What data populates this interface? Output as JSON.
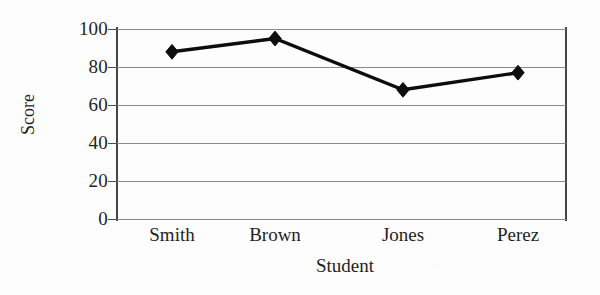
{
  "chart_data": {
    "type": "line",
    "title": "",
    "subtitle": "",
    "xlabel": "Student",
    "ylabel": "Score",
    "categories": [
      "Smith",
      "Brown",
      "Jones",
      "Perez"
    ],
    "values": [
      88,
      95,
      68,
      77
    ],
    "series": [
      {
        "name": "Score",
        "values": [
          88,
          95,
          68,
          77
        ],
        "marker": "diamond",
        "line_color": "#0d0d0d",
        "marker_color": "#0d0d0d"
      }
    ],
    "ylim": [
      0,
      100
    ],
    "yticks": [
      0,
      20,
      40,
      60,
      80,
      100
    ],
    "ytick_labels": [
      "0",
      "20",
      "40",
      "60",
      "80",
      "100"
    ],
    "xtick_labels": [
      "Smith",
      "Brown",
      "Jones",
      "Perez"
    ],
    "grid": true,
    "grid_axis": "y",
    "grid_color": "#8a8a8a",
    "legend": false,
    "legend_position": "none",
    "axis_color": "#454545",
    "background_color": "#fdfdfd",
    "text_color": "#1f1f1f",
    "points": [
      {
        "category": "Smith",
        "value": 88
      },
      {
        "category": "Brown",
        "value": 95
      },
      {
        "category": "Jones",
        "value": 68
      },
      {
        "category": "Perez",
        "value": 77
      }
    ]
  }
}
